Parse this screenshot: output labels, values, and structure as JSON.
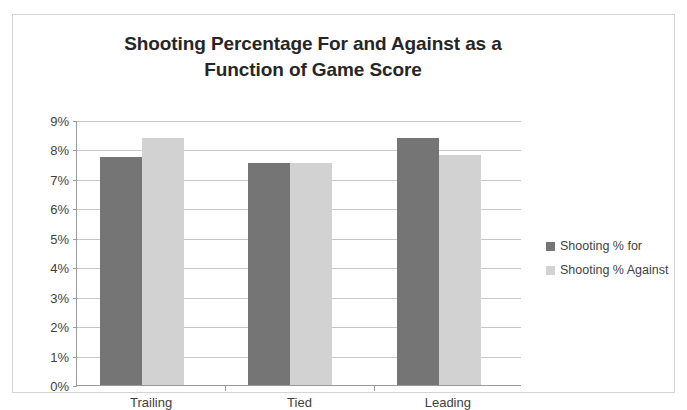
{
  "chart_data": {
    "type": "bar",
    "title": "Shooting Percentage For and Against as a Function of Game Score",
    "title_line1": "Shooting Percentage For and Against as a",
    "title_line2": "Function of Game Score",
    "xlabel": "",
    "ylabel": "",
    "categories": [
      "Trailing",
      "Tied",
      "Leading"
    ],
    "series": [
      {
        "name": "Shooting % for",
        "color": "#757575",
        "values": [
          7.75,
          7.55,
          8.4
        ],
        "value_labels": [
          "7.75%",
          "7.55%",
          "8.4%"
        ]
      },
      {
        "name": "Shooting % Against",
        "color": "#d2d2d2",
        "values": [
          8.4,
          7.55,
          7.8
        ],
        "value_labels": [
          "8.4%",
          "7.55%",
          "7.8%"
        ]
      }
    ],
    "ylim": [
      0,
      9
    ],
    "ytick_step": 1,
    "ytick_labels": [
      "0%",
      "1%",
      "2%",
      "3%",
      "4%",
      "5%",
      "6%",
      "7%",
      "8%",
      "9%"
    ],
    "ytick_values": [
      0,
      1,
      2,
      3,
      4,
      5,
      6,
      7,
      8,
      9
    ],
    "grid": true,
    "grid_axis": "y",
    "legend_position": "right",
    "plot_background": "#ffffff",
    "gridline_color": "#c8c8c8",
    "axis_color": "#9a9a9a",
    "title_color": "#262626",
    "tick_label_color": "#3f3f3f",
    "border_color": "#d4d4d4"
  }
}
